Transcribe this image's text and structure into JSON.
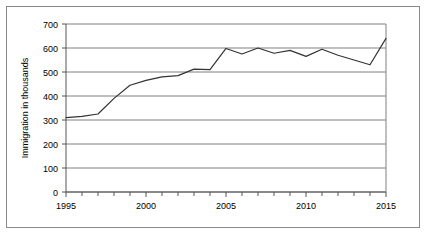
{
  "chart_data": {
    "type": "line",
    "title": "",
    "xlabel": "",
    "ylabel": "Immigration in thousands",
    "x": [
      1995,
      1996,
      1997,
      1998,
      1999,
      2000,
      2001,
      2002,
      2003,
      2004,
      2005,
      2006,
      2007,
      2008,
      2009,
      2010,
      2011,
      2012,
      2013,
      2014,
      2015
    ],
    "values": [
      310,
      315,
      325,
      390,
      445,
      465,
      480,
      485,
      512,
      510,
      598,
      575,
      600,
      578,
      590,
      565,
      595,
      570,
      550,
      530,
      640
    ],
    "series": [
      {
        "name": "Immigration",
        "values": [
          310,
          315,
          325,
          390,
          445,
          465,
          480,
          485,
          512,
          510,
          598,
          575,
          600,
          578,
          590,
          565,
          595,
          570,
          550,
          530,
          640
        ]
      }
    ],
    "xlim": [
      1995,
      2015
    ],
    "ylim": [
      0,
      700
    ],
    "ytick_labels": [
      "0",
      "100",
      "200",
      "300",
      "400",
      "500",
      "600",
      "700"
    ],
    "ytick_values": [
      0,
      100,
      200,
      300,
      400,
      500,
      600,
      700
    ],
    "xtick_labels": [
      "1995",
      "2000",
      "2005",
      "2010",
      "2015"
    ],
    "xtick_values": [
      1995,
      2000,
      2005,
      2010,
      2015
    ],
    "xminor_step": 1,
    "grid": "horizontal",
    "legend": "none",
    "line_color": "#333333",
    "grid_color": "#808080",
    "axis_color": "#555555",
    "background_color": "#ffffff",
    "frame": true
  },
  "axis": {
    "ylabel": "Immigration in thousands",
    "yticks": [
      {
        "label": "700",
        "value": 700
      },
      {
        "label": "600",
        "value": 600
      },
      {
        "label": "500",
        "value": 500
      },
      {
        "label": "400",
        "value": 400
      },
      {
        "label": "300",
        "value": 300
      },
      {
        "label": "200",
        "value": 200
      },
      {
        "label": "100",
        "value": 100
      },
      {
        "label": "0",
        "value": 0
      }
    ],
    "xticks": [
      {
        "label": "1995",
        "value": 1995
      },
      {
        "label": "2000",
        "value": 2000
      },
      {
        "label": "2005",
        "value": 2005
      },
      {
        "label": "2010",
        "value": 2010
      },
      {
        "label": "2015",
        "value": 2015
      }
    ]
  }
}
